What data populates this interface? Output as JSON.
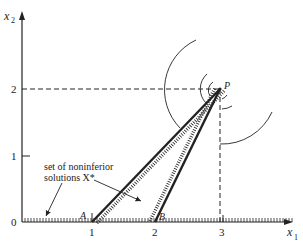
{
  "axes": {
    "x_label": "x",
    "x_sub": "1",
    "y_label": "x",
    "y_sub": "2",
    "x_ticks": [
      "1",
      "2",
      "3"
    ],
    "y_ticks": [
      "0",
      "1",
      "2"
    ]
  },
  "points": {
    "P": "P",
    "A": "A",
    "B": "B"
  },
  "annotation": {
    "line1": "set of noninferior",
    "line2": "solutions X*"
  },
  "colors": {
    "ink": "#222222",
    "background": "#ffffff"
  }
}
